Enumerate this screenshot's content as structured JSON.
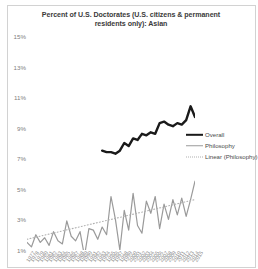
{
  "chart_data": {
    "type": "line",
    "title": "Percent of U.S. Doctorates (U.S. citizens & permanent residents only): Asian",
    "xlabel": "",
    "ylabel": "",
    "ylim": [
      1,
      15
    ],
    "yticks": [
      "1%",
      "3%",
      "5%",
      "7%",
      "9%",
      "11%",
      "13%",
      "15%"
    ],
    "ytick_values": [
      1,
      3,
      5,
      7,
      9,
      11,
      13,
      15
    ],
    "grid": false,
    "legend_position": "right",
    "x": [
      1977,
      1978,
      1979,
      1980,
      1981,
      1982,
      1983,
      1984,
      1985,
      1986,
      1987,
      1988,
      1989,
      1990,
      1991,
      1992,
      1993,
      1994,
      1995,
      1996,
      1997,
      1998,
      1999,
      2000,
      2001,
      2002,
      2003,
      2004,
      2005,
      2006,
      2007,
      2008,
      2009,
      2010,
      2011,
      2012,
      2013,
      2014,
      2015
    ],
    "xticks": [
      "1977",
      "1978",
      "1979",
      "1980",
      "1981",
      "1982",
      "1983",
      "1984",
      "1985",
      "1986",
      "1987",
      "1988",
      "1989",
      "1990",
      "1991",
      "1992",
      "1993",
      "1994",
      "1995",
      "1996",
      "1997",
      "1998",
      "1999",
      "2000",
      "2001",
      "2002",
      "2003",
      "2004",
      "2005",
      "2006",
      "2007",
      "2008",
      "2009",
      "2010",
      "2011",
      "2012",
      "2013",
      "2014",
      "2015"
    ],
    "series": [
      {
        "name": "Overall",
        "color": "#1a1a1a",
        "style": "solid",
        "width": 2.4,
        "x": [
          1994,
          1995,
          1996,
          1997,
          1998,
          1999,
          2000,
          2001,
          2002,
          2003,
          2004,
          2005,
          2006,
          2007,
          2008,
          2009,
          2010,
          2011,
          2012,
          2013,
          2014,
          2015
        ],
        "values": [
          7.5,
          7.4,
          7.4,
          7.3,
          7.5,
          8.0,
          7.8,
          8.3,
          8.2,
          8.6,
          8.5,
          8.7,
          8.6,
          9.3,
          9.4,
          9.2,
          9.1,
          9.3,
          9.2,
          9.5,
          10.4,
          9.7
        ]
      },
      {
        "name": "Philosophy",
        "color": "#9a9a9a",
        "style": "solid",
        "width": 1.2,
        "x": [
          1977,
          1978,
          1979,
          1980,
          1981,
          1982,
          1983,
          1984,
          1985,
          1986,
          1987,
          1988,
          1989,
          1990,
          1991,
          1992,
          1993,
          1994,
          1995,
          1996,
          1997,
          1998,
          1999,
          2000,
          2001,
          2002,
          2003,
          2004,
          2005,
          2006,
          2007,
          2008,
          2009,
          2010,
          2011,
          2012,
          2013,
          2014,
          2015
        ],
        "values": [
          1.5,
          1.2,
          2.0,
          1.5,
          1.8,
          1.3,
          2.2,
          1.6,
          1.4,
          2.9,
          1.9,
          1.6,
          2.2,
          0.6,
          2.4,
          2.3,
          1.7,
          2.5,
          2.0,
          4.5,
          3.0,
          1.0,
          3.6,
          2.3,
          4.7,
          2.6,
          2.1,
          4.2,
          3.4,
          4.5,
          2.4,
          4.0,
          3.0,
          4.3,
          3.3,
          4.4,
          3.2,
          4.3,
          5.5
        ]
      },
      {
        "name": "Linear (Philosophy)",
        "color": "#b0b0b0",
        "style": "dotted",
        "width": 1.1,
        "trend": true,
        "x": [
          1977,
          2015
        ],
        "values": [
          1.7,
          4.3
        ]
      }
    ]
  },
  "legend": {
    "items": [
      {
        "label": "Overall",
        "swatch": "overall"
      },
      {
        "label": "Philosophy",
        "swatch": "philosophy"
      },
      {
        "label": "Linear (Philosophy)",
        "swatch": "trend"
      }
    ]
  },
  "colors": {
    "overall": "#1a1a1a",
    "philosophy": "#9a9a9a",
    "trend": "#b0b0b0",
    "axis_text": "#808080",
    "title_text": "#3a3a3a",
    "frame": "#d2d2d2"
  }
}
